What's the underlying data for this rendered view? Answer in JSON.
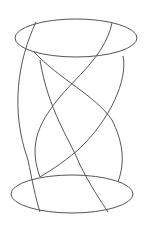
{
  "figure": {
    "type": "twisted-helix-cylinder-line-drawing",
    "stroke_color": "#555555",
    "background": "#ffffff",
    "top_ellipse": {
      "cx": 76,
      "cy": 38,
      "rx": 61,
      "ry": 19
    },
    "bottom_ellipse": {
      "cx": 72,
      "cy": 194,
      "rx": 61,
      "ry": 19
    },
    "strands": [
      {
        "name": "strand-a",
        "d": "M36 22 C 18 60, 10 110, 28 160 C 32 180, 36 200, 40 212"
      },
      {
        "name": "strand-b",
        "d": "M112 23 C 104 60, 70 80, 50 110 C 36 130, 30 150, 40 177"
      },
      {
        "name": "strand-c",
        "d": "M33 51 C 60 80, 95 95, 112 120 C 122 140, 126 160, 118 182"
      },
      {
        "name": "strand-d",
        "d": "M123 56 C 128 80, 110 120, 78 150 C 60 165, 48 172, 40 177"
      },
      {
        "name": "strand-e",
        "d": "M40 60 C 48 110, 70 140, 80 165 C 90 185, 100 200, 108 212"
      }
    ]
  }
}
